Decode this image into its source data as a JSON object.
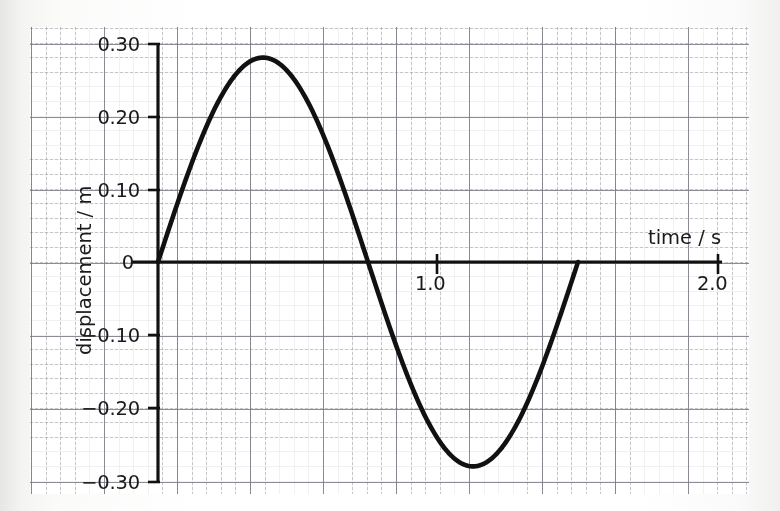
{
  "figure": {
    "axis_color": "#111111",
    "curve_color": "#111111",
    "grid_major_color": "#787882",
    "grid_minor_color": "#9696a0",
    "paper_color": "#ffffff",
    "background_color": "#f2f2f0"
  },
  "chart_data": {
    "type": "line",
    "title": "",
    "xlabel": "time / s",
    "ylabel": "displacement / m",
    "xlim": [
      0,
      2.0
    ],
    "ylim": [
      -0.3,
      0.3
    ],
    "xticks": [
      {
        "value": 1.0,
        "label": "1.0"
      },
      {
        "value": 2.0,
        "label": "2.0"
      }
    ],
    "yticks": [
      {
        "value": 0.3,
        "label": "0.30"
      },
      {
        "value": 0.2,
        "label": "0.20"
      },
      {
        "value": 0.1,
        "label": "0.10"
      },
      {
        "value": 0.0,
        "label": "0"
      },
      {
        "value": -0.1,
        "label": "−0.10"
      },
      {
        "value": -0.2,
        "label": "−0.20"
      },
      {
        "value": -0.3,
        "label": "−0.30"
      }
    ],
    "grid": true,
    "grid_minor_spacing": 0.05,
    "grid_major_spacing": 0.25,
    "legend": null,
    "series": [
      {
        "name": "displacement",
        "waveform": "sine",
        "amplitude": 0.28,
        "period": 1.5,
        "phase": 0,
        "t_start": 0.0,
        "t_end": 1.5,
        "key_points": [
          {
            "t": 0.0,
            "y": 0.0
          },
          {
            "t": 0.375,
            "y": 0.28
          },
          {
            "t": 0.75,
            "y": 0.0
          },
          {
            "t": 1.125,
            "y": -0.28
          },
          {
            "t": 1.5,
            "y": 0.0
          }
        ],
        "x": [
          0.0,
          0.075,
          0.15,
          0.225,
          0.3,
          0.375,
          0.45,
          0.525,
          0.6,
          0.675,
          0.75,
          0.825,
          0.9,
          0.975,
          1.05,
          1.125,
          1.2,
          1.275,
          1.35,
          1.425,
          1.5
        ],
        "y": [
          0.0,
          0.086,
          0.165,
          0.226,
          0.266,
          0.28,
          0.266,
          0.226,
          0.165,
          0.086,
          0.0,
          -0.086,
          -0.165,
          -0.226,
          -0.266,
          -0.28,
          -0.266,
          -0.226,
          -0.165,
          -0.086,
          0.0
        ]
      }
    ]
  },
  "labels": {
    "x_axis_title": "time / s",
    "y_axis_title": "displacement / m",
    "y_0_30": "0.30",
    "y_0_20": "0.20",
    "y_0_10": "0.10",
    "y_0": "0",
    "y_m0_10": "−0.10",
    "y_m0_20": "−0.20",
    "y_m0_30": "−0.30",
    "x_1_0": "1.0",
    "x_2_0": "2.0"
  }
}
